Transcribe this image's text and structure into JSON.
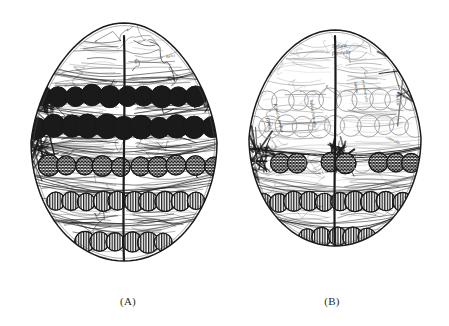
{
  "page": {
    "width": 449,
    "height": 326,
    "background_color": "#ffffff",
    "ink_color": "#1a1a1a",
    "mid_ink_color": "#555555",
    "light_ink_color": "#9a9a9a"
  },
  "captions": [
    {
      "id": "caption-a",
      "label": "(A)"
    },
    {
      "id": "caption-b",
      "label": "(B)"
    }
  ],
  "figures": [
    {
      "id": "figure-a",
      "caption": "(A)",
      "x": 18,
      "y": 14,
      "width": 212,
      "height": 272,
      "outline": {
        "cx": 106,
        "cy": 128,
        "rx": 93,
        "ry": 119,
        "shape": "ovoid",
        "taper": 0.86
      },
      "midline": {
        "x": 106,
        "y1": 22,
        "y2": 248
      },
      "circle_rows": [
        {
          "name": "row-1-filled",
          "y": 82,
          "count": 11,
          "radius": 10.5,
          "fill": "dark",
          "spacing": 17.0,
          "x_start": 24,
          "jitter": 1.2
        },
        {
          "name": "row-2-filled",
          "y": 113,
          "count": 12,
          "radius": 11.5,
          "fill": "dark",
          "spacing": 17.6,
          "x_start": 18,
          "jitter": 1.4
        },
        {
          "name": "row-3-crosshatch",
          "y": 152,
          "count": 10,
          "radius": 10.0,
          "fill": "crosshatch",
          "spacing": 18.4,
          "x_start": 30,
          "jitter": 1.1
        },
        {
          "name": "row-4-striped",
          "y": 187,
          "count": 13,
          "radius": 9.5,
          "fill": "stripe",
          "spacing": 15.6,
          "x_start": 22,
          "jitter": 1.0
        },
        {
          "name": "row-5-striped",
          "y": 228,
          "count": 13,
          "radius": 9.8,
          "fill": "stripe",
          "spacing": 15.6,
          "x_start": 20,
          "jitter": 1.0
        }
      ],
      "band_lines": [
        {
          "y": 58,
          "amplitude": 11,
          "count": 5,
          "weight": 0.7
        },
        {
          "y": 96,
          "amplitude": 9,
          "count": 4,
          "weight": 0.8
        },
        {
          "y": 131,
          "amplitude": 13,
          "count": 7,
          "weight": 0.9
        },
        {
          "y": 166,
          "amplitude": 12,
          "count": 6,
          "weight": 0.9
        },
        {
          "y": 205,
          "amplitude": 11,
          "count": 6,
          "weight": 0.8
        },
        {
          "y": 246,
          "amplitude": 9,
          "count": 5,
          "weight": 0.7
        }
      ],
      "annotations": [
        {
          "text": "Sulci",
          "x": 148,
          "y": 44,
          "rotate": -8,
          "size": 4.5
        },
        {
          "text": "gyrus",
          "x": 178,
          "y": 60,
          "rotate": 62,
          "size": 4.2
        },
        {
          "text": "ossa",
          "x": 43,
          "y": 142,
          "rotate": -18,
          "size": 4.2
        },
        {
          "text": "sutura",
          "x": 46,
          "y": 212,
          "rotate": -12,
          "size": 4.2
        }
      ],
      "style": {
        "density": "high",
        "tone": "dark",
        "hatch_shading": true
      }
    },
    {
      "id": "figure-b",
      "caption": "(B)",
      "x": 236,
      "y": 22,
      "width": 198,
      "height": 248,
      "outline": {
        "cx": 99,
        "cy": 116,
        "rx": 86,
        "ry": 108,
        "shape": "ovoid",
        "taper": 0.9
      },
      "midline": {
        "x": 99,
        "y1": 14,
        "y2": 228
      },
      "circle_rows": [
        {
          "name": "row-1-outline",
          "y": 78,
          "count": 11,
          "radius": 10.5,
          "fill": "outline",
          "spacing": 16.2,
          "x_start": 14,
          "jitter": 1.2
        },
        {
          "name": "row-2-outline",
          "y": 104,
          "count": 11,
          "radius": 10.5,
          "fill": "outline",
          "spacing": 16.2,
          "x_start": 18,
          "jitter": 1.3
        },
        {
          "name": "row-3-mixed",
          "y": 141,
          "count": 11,
          "radius": 9.8,
          "fill": "mixed",
          "spacing": 16.4,
          "x_start": 12,
          "jitter": 1.1
        },
        {
          "name": "row-4-striped",
          "y": 180,
          "count": 12,
          "radius": 9.5,
          "fill": "stripe",
          "spacing": 15.4,
          "x_start": 12,
          "jitter": 1.0
        },
        {
          "name": "row-5-striped",
          "y": 215,
          "count": 12,
          "radius": 9.5,
          "fill": "stripe",
          "spacing": 15.2,
          "x_start": 10,
          "jitter": 1.0
        }
      ],
      "band_lines": [
        {
          "y": 126,
          "amplitude": 10,
          "count": 5,
          "weight": 0.9
        },
        {
          "y": 160,
          "amplitude": 12,
          "count": 6,
          "weight": 0.9
        },
        {
          "y": 197,
          "amplitude": 11,
          "count": 6,
          "weight": 0.8
        },
        {
          "y": 232,
          "amplitude": 8,
          "count": 5,
          "weight": 0.7
        }
      ],
      "annotations": [
        {
          "text": "Sutura",
          "x": 96,
          "y": 26,
          "rotate": -4,
          "size": 5.6
        },
        {
          "text": "frontalis",
          "x": 96,
          "y": 33,
          "rotate": -4,
          "size": 5.6
        },
        {
          "text": "Gyrus",
          "x": 30,
          "y": 96,
          "rotate": 76,
          "size": 5.0
        },
        {
          "text": "frontalis medius",
          "x": 38,
          "y": 82,
          "rotate": 76,
          "size": 4.6
        },
        {
          "text": "Sulcus frontalis",
          "x": 74,
          "y": 78,
          "rotate": 82,
          "size": 4.4
        },
        {
          "text": "Sulcus",
          "x": 118,
          "y": 60,
          "rotate": 80,
          "size": 4.4
        },
        {
          "text": "praecentralis",
          "x": 126,
          "y": 58,
          "rotate": 80,
          "size": 4.2
        },
        {
          "text": "Sulcus",
          "x": 160,
          "y": 72,
          "rotate": 86,
          "size": 4.4
        },
        {
          "text": "centralis",
          "x": 150,
          "y": 116,
          "rotate": 26,
          "size": 4.2
        },
        {
          "text": "sulcus",
          "x": 82,
          "y": 152,
          "rotate": -6,
          "size": 4.2
        },
        {
          "text": "gyrus",
          "x": 78,
          "y": 186,
          "rotate": -6,
          "size": 4.2
        },
        {
          "text": "lambda",
          "x": 78,
          "y": 224,
          "rotate": -3,
          "size": 4.6
        }
      ],
      "style": {
        "density": "medium",
        "tone": "light",
        "hatch_shading": true
      }
    }
  ]
}
